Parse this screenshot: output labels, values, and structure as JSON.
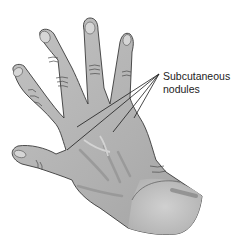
{
  "figure": {
    "annotation": {
      "line1": "Subcutaneous",
      "line2": "nodules",
      "leader_origin": [
        159,
        74
      ],
      "leader_targets": [
        [
          77,
          127
        ],
        [
          67,
          150
        ],
        [
          113,
          132
        ],
        [
          134,
          118
        ]
      ]
    },
    "colors": {
      "skin": "#b4b4b4",
      "skin_light": "#cfcfcf",
      "skin_dark": "#8e8e8e",
      "outline": "#3a3a3a",
      "nail": "#d6d6d6",
      "leader": "#1a1a1a",
      "text": "#222222"
    }
  }
}
